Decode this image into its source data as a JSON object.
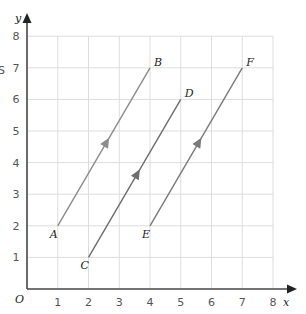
{
  "diagram": {
    "title": "",
    "axes": {
      "x_label": "x",
      "y_label": "y",
      "origin_label": "O",
      "x_ticks": [
        "1",
        "2",
        "3",
        "4",
        "5",
        "6",
        "7",
        "8"
      ],
      "y_ticks": [
        "1",
        "2",
        "3",
        "4",
        "5",
        "6",
        "7",
        "8"
      ],
      "xlim": [
        0,
        8
      ],
      "ylim": [
        0,
        8
      ],
      "grid": true
    },
    "vectors": [
      {
        "from": "A",
        "to": "B",
        "start": [
          1,
          2
        ],
        "end": [
          4,
          7
        ],
        "color": "#8c8c8c"
      },
      {
        "from": "C",
        "to": "D",
        "start": [
          2,
          1
        ],
        "end": [
          5,
          6
        ],
        "color": "#6e6e6e"
      },
      {
        "from": "E",
        "to": "F",
        "start": [
          4,
          2
        ],
        "end": [
          7,
          7
        ],
        "color": "#7a7a7a"
      }
    ],
    "points": [
      {
        "label": "A",
        "x": 1,
        "y": 2
      },
      {
        "label": "B",
        "x": 4,
        "y": 7
      },
      {
        "label": "C",
        "x": 2,
        "y": 1
      },
      {
        "label": "D",
        "x": 5,
        "y": 6
      },
      {
        "label": "E",
        "x": 4,
        "y": 2
      },
      {
        "label": "F",
        "x": 7,
        "y": 7
      }
    ],
    "margin_artifact": "S",
    "colors": {
      "grid": "#dddddd",
      "axis": "#444444"
    }
  }
}
